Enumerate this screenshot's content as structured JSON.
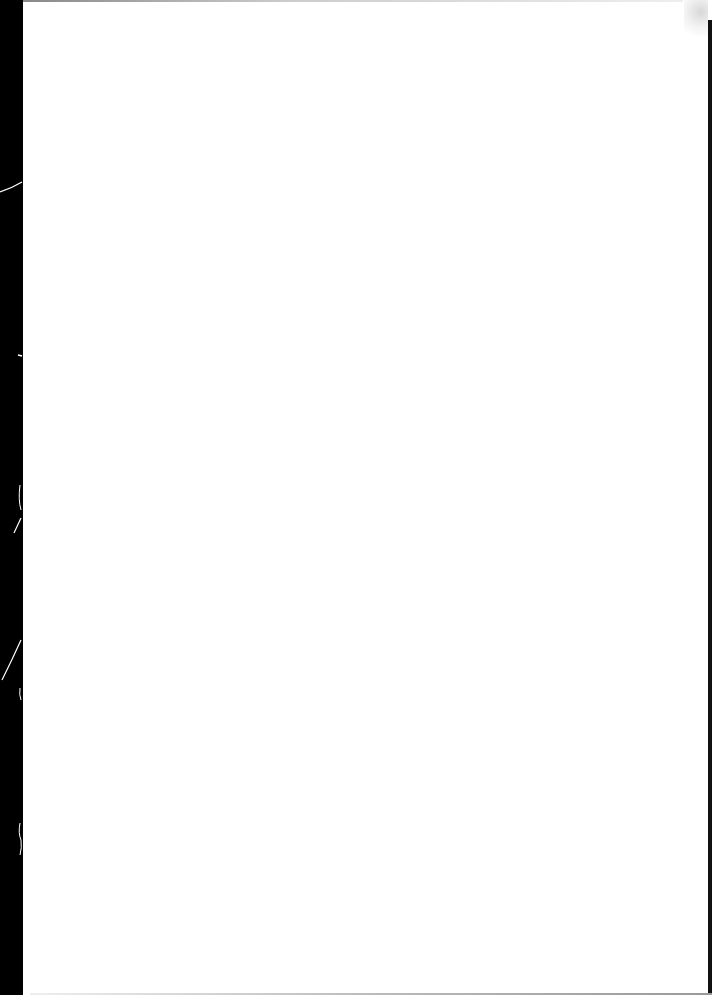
{
  "page": {
    "type": "blank scanned page",
    "background_color": "#ffffff",
    "binding_color": "#000000",
    "text": ""
  }
}
